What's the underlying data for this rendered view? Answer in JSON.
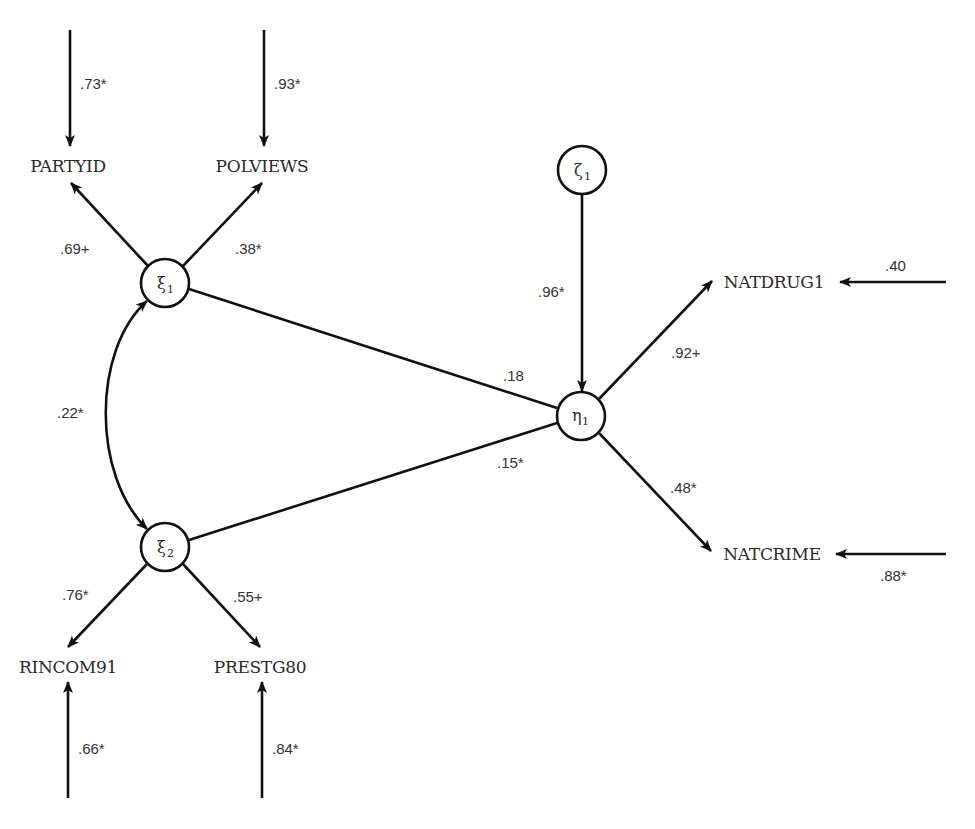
{
  "diagram": {
    "type": "structural-equation-model",
    "colors": {
      "stroke": "#111111",
      "text": "#2a2a2a",
      "background": "#ffffff"
    },
    "latent_nodes": [
      {
        "id": "xi1",
        "symbol": "ξ",
        "subscript": "1",
        "cx": 165,
        "cy": 283,
        "r": 24
      },
      {
        "id": "xi2",
        "symbol": "ξ",
        "subscript": "2",
        "cx": 165,
        "cy": 547,
        "r": 24
      },
      {
        "id": "eta1",
        "symbol": "η",
        "subscript": "1",
        "cx": 581,
        "cy": 416,
        "r": 24
      },
      {
        "id": "zeta1",
        "symbol": "ζ",
        "subscript": "1",
        "cx": 582,
        "cy": 170,
        "r": 24
      }
    ],
    "observed_nodes": [
      {
        "id": "partyid",
        "label": "PARTYID",
        "x": 68,
        "y": 172
      },
      {
        "id": "polviews",
        "label": "POLVIEWS",
        "x": 262,
        "y": 172
      },
      {
        "id": "rincom91",
        "label": "RINCOM91",
        "x": 68,
        "y": 673
      },
      {
        "id": "prestg80",
        "label": "PRESTG80",
        "x": 260,
        "y": 673
      },
      {
        "id": "natdrug1",
        "label": "NATDRUG1",
        "x": 774,
        "y": 288
      },
      {
        "id": "natcrime",
        "label": "NATCRIME",
        "x": 772,
        "y": 560
      }
    ],
    "error_paths": [
      {
        "target": "partyid",
        "value": ".73*"
      },
      {
        "target": "polviews",
        "value": ".93*"
      },
      {
        "target": "rincom91",
        "value": ".66*"
      },
      {
        "target": "prestg80",
        "value": ".84*"
      },
      {
        "target": "natdrug1",
        "value": ".40"
      },
      {
        "target": "natcrime",
        "value": ".88*"
      }
    ],
    "loadings": [
      {
        "from": "xi1",
        "to": "partyid",
        "value": ".69+"
      },
      {
        "from": "xi1",
        "to": "polviews",
        "value": ".38*"
      },
      {
        "from": "xi2",
        "to": "rincom91",
        "value": ".76*"
      },
      {
        "from": "xi2",
        "to": "prestg80",
        "value": ".55+"
      },
      {
        "from": "eta1",
        "to": "natdrug1",
        "value": ".92+"
      },
      {
        "from": "eta1",
        "to": "natcrime",
        "value": ".48*"
      }
    ],
    "structural_paths": [
      {
        "from": "xi1",
        "to": "eta1",
        "value": ".18"
      },
      {
        "from": "xi2",
        "to": "eta1",
        "value": ".15*"
      },
      {
        "from": "zeta1",
        "to": "eta1",
        "value": ".96*"
      }
    ],
    "correlations": [
      {
        "between": [
          "xi1",
          "xi2"
        ],
        "value": ".22*"
      }
    ]
  }
}
